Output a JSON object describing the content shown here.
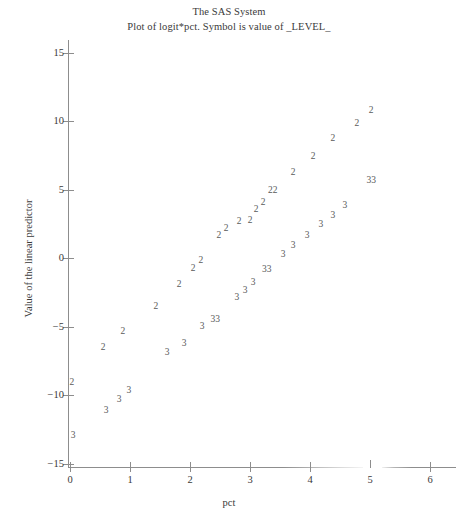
{
  "titles": {
    "main": "The SAS System",
    "sub": "Plot of logit*pct. Symbol is value of _LEVEL_"
  },
  "axes": {
    "xlabel": "pct",
    "ylabel": "Value of the linear predictor",
    "xticks": [
      "0",
      "1",
      "2",
      "3",
      "4",
      "5",
      "6"
    ],
    "yticks": [
      "15",
      "10",
      "5",
      "0",
      "-5",
      "-10",
      "-15"
    ]
  },
  "chart_data": {
    "type": "scatter",
    "title": "The SAS System",
    "subtitle": "Plot of logit*pct. Symbol is value of _LEVEL_",
    "xlabel": "pct",
    "ylabel": "Value of the linear predictor",
    "xlim": [
      0,
      6
    ],
    "ylim": [
      -16.5,
      16.5
    ],
    "grid": false,
    "legend": "none",
    "point_symbols": [
      "2",
      "3"
    ],
    "series": [
      {
        "name": "2",
        "symbol": "2",
        "points": [
          {
            "x": 0.03,
            "y": -9.1,
            "label": "2"
          },
          {
            "x": 0.55,
            "y": -6.6,
            "label": "2"
          },
          {
            "x": 0.88,
            "y": -5.4,
            "label": "2"
          },
          {
            "x": 1.43,
            "y": -3.6,
            "label": "2"
          },
          {
            "x": 1.82,
            "y": -2.0,
            "label": "2"
          },
          {
            "x": 2.05,
            "y": -0.8,
            "label": "2"
          },
          {
            "x": 2.18,
            "y": -0.2,
            "label": "2"
          },
          {
            "x": 2.48,
            "y": 1.6,
            "label": "2"
          },
          {
            "x": 2.6,
            "y": 2.1,
            "label": "2"
          },
          {
            "x": 2.82,
            "y": 2.6,
            "label": "2"
          },
          {
            "x": 3.0,
            "y": 2.7,
            "label": "2"
          },
          {
            "x": 3.1,
            "y": 3.5,
            "label": "2"
          },
          {
            "x": 3.22,
            "y": 4.0,
            "label": "2"
          },
          {
            "x": 3.38,
            "y": 4.9,
            "label": "22"
          },
          {
            "x": 3.72,
            "y": 6.2,
            "label": "2"
          },
          {
            "x": 4.05,
            "y": 7.4,
            "label": "2"
          },
          {
            "x": 4.38,
            "y": 8.7,
            "label": "2"
          },
          {
            "x": 4.78,
            "y": 9.8,
            "label": "2"
          },
          {
            "x": 5.02,
            "y": 10.7,
            "label": "2"
          }
        ]
      },
      {
        "name": "3",
        "symbol": "3",
        "points": [
          {
            "x": 0.05,
            "y": -13.0,
            "label": "3"
          },
          {
            "x": 0.6,
            "y": -11.2,
            "label": "3"
          },
          {
            "x": 0.82,
            "y": -10.4,
            "label": "3"
          },
          {
            "x": 0.98,
            "y": -9.7,
            "label": "3"
          },
          {
            "x": 1.62,
            "y": -6.9,
            "label": "3"
          },
          {
            "x": 1.9,
            "y": -6.3,
            "label": "3"
          },
          {
            "x": 2.2,
            "y": -5.0,
            "label": "3"
          },
          {
            "x": 2.42,
            "y": -4.5,
            "label": "33"
          },
          {
            "x": 2.78,
            "y": -2.9,
            "label": "3"
          },
          {
            "x": 2.92,
            "y": -2.4,
            "label": "3"
          },
          {
            "x": 3.05,
            "y": -1.8,
            "label": "3"
          },
          {
            "x": 3.28,
            "y": -0.9,
            "label": "33"
          },
          {
            "x": 3.55,
            "y": 0.2,
            "label": "3"
          },
          {
            "x": 3.72,
            "y": 0.9,
            "label": "3"
          },
          {
            "x": 3.95,
            "y": 1.6,
            "label": "3"
          },
          {
            "x": 4.18,
            "y": 2.4,
            "label": "3"
          },
          {
            "x": 4.38,
            "y": 3.1,
            "label": "3"
          },
          {
            "x": 4.58,
            "y": 3.8,
            "label": "3"
          },
          {
            "x": 5.02,
            "y": 5.6,
            "label": "33"
          }
        ]
      }
    ]
  },
  "geometry": {
    "x0_px": 70,
    "px_per_x": 60,
    "y0_px": 258,
    "px_per_y": 13.7
  }
}
